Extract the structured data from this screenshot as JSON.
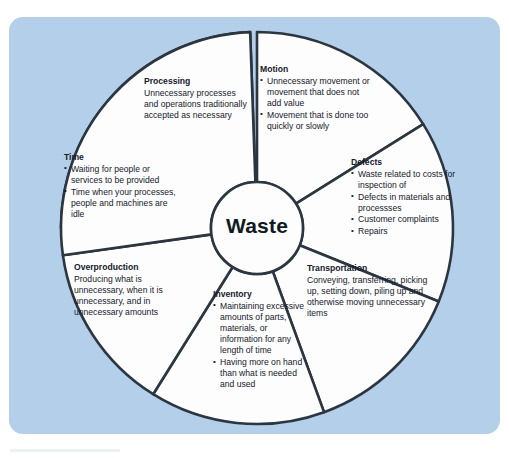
{
  "diagram": {
    "title": "Waste",
    "hub_label": "Waste",
    "accent_color": "#9dc3e2",
    "panel_color": "#b3cfea",
    "outline_color": "#2b3640",
    "segments": [
      {
        "id": "processing",
        "title": "Processing",
        "highlighted": true,
        "body": "Unnecessary processes and operations traditionally accepted as necessary",
        "bullets": []
      },
      {
        "id": "motion",
        "title": "Motion",
        "highlighted": false,
        "body": "",
        "bullets": [
          "Unnecessary movement or movement that does not add value",
          "Movement that is done too quickly or slowly"
        ]
      },
      {
        "id": "defects",
        "title": "Defects",
        "highlighted": false,
        "body": "",
        "bullets": [
          "Waste related to costs for inspection of",
          "Defects in materials and processses",
          "Customer complaints",
          "Repairs"
        ]
      },
      {
        "id": "transportation",
        "title": "Transportation",
        "highlighted": false,
        "body": "Conveying, transferring, picking up, setting down, piling up and otherwise moving unnecessary items",
        "bullets": []
      },
      {
        "id": "inventory",
        "title": "Inventory",
        "highlighted": false,
        "body": "",
        "bullets": [
          "Maintaining excessive amounts of parts, materials, or information for any length of time",
          "Having more on hand than what is needed and used"
        ]
      },
      {
        "id": "overproduction",
        "title": "Overproduction",
        "highlighted": false,
        "body": "Producing what is unnecessary, when it is unnecessary, and in unnecessary amounts",
        "bullets": []
      },
      {
        "id": "time",
        "title": "Time",
        "highlighted": false,
        "body": "",
        "bullets": [
          "Waiting for people or services  to be provided",
          "Time when your processes, people and machines are idle"
        ]
      }
    ]
  }
}
